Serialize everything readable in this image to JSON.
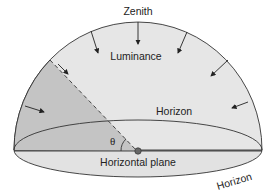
{
  "diagram": {
    "type": "sky-dome-illuminance",
    "labels": {
      "zenith": "Zenith",
      "luminance": "Luminance",
      "horizon_back": "Horizon",
      "horizon_front": "Horizon",
      "horizontal_plane": "Horizontal plane",
      "angle": "θ"
    },
    "colors": {
      "dome_fill": "#e6e6e6",
      "shaded_sector": "#c4c4c4",
      "plane_fill": "#e2e2e2",
      "stroke": "#333333",
      "point": "#666666"
    }
  }
}
